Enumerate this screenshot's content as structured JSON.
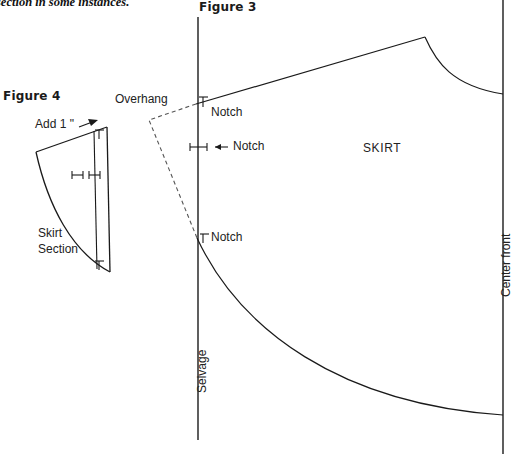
{
  "page": {
    "width": 517,
    "height": 454,
    "background": "#ffffff",
    "ink": "#1a1a1a",
    "cut_off_body_text": "section in some instances."
  },
  "figure3": {
    "heading": "Figure 3",
    "piece_label": "SKIRT",
    "overhang_label": "Overhang",
    "selvage_label": "Selvage",
    "center_front_label": "Center front",
    "notches": [
      {
        "id": "notch-top",
        "label": "Notch"
      },
      {
        "id": "notch-middle",
        "label": "Notch"
      },
      {
        "id": "notch-lower",
        "label": "Notch"
      }
    ]
  },
  "figure4": {
    "heading": "Figure 4",
    "add_label": "Add 1 \"",
    "piece_label_line1": "Skirt",
    "piece_label_line2": "Section"
  }
}
